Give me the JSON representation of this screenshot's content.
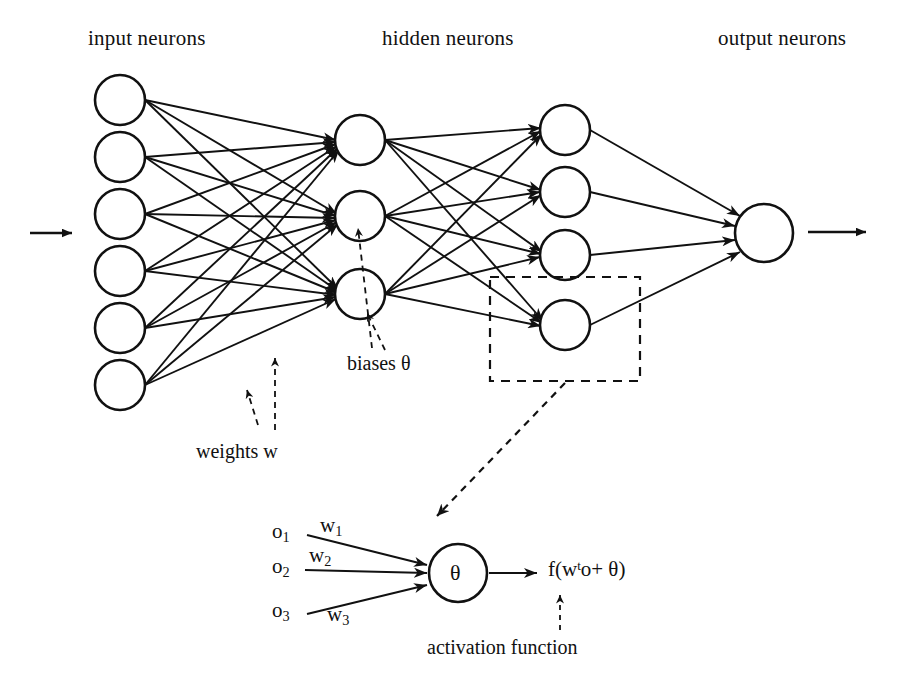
{
  "figure": {
    "background_color": "#ffffff",
    "stroke_color": "#111111"
  },
  "layer_labels": {
    "input": "input neurons",
    "hidden": "hidden neurons",
    "output": "output neurons"
  },
  "annotations": {
    "weights": "weights w",
    "biases": "biases  θ",
    "activation": "activation function"
  },
  "inset": {
    "input_1": "o",
    "input_1_sub": "1",
    "input_2": "o",
    "input_2_sub": "2",
    "input_3": "o",
    "input_3_sub": "3",
    "weight_1": "w",
    "weight_1_sub": "1",
    "weight_2": "w",
    "weight_2_sub": "2",
    "weight_3": "w",
    "weight_3_sub": "3",
    "neuron_symbol": "θ",
    "output_f": "f(w",
    "output_sup": "t",
    "output_rest": "o+ θ)"
  },
  "network": {
    "layers": [
      {
        "name": "input",
        "count": 6,
        "cx": 120,
        "r": 25,
        "ys": [
          100,
          157,
          214,
          271,
          328,
          385
        ]
      },
      {
        "name": "hidden1",
        "count": 3,
        "cx": 360,
        "r": 25,
        "ys": [
          140,
          216,
          294
        ]
      },
      {
        "name": "hidden2",
        "count": 4,
        "cx": 565,
        "r": 25,
        "ys": [
          130,
          192,
          255,
          325
        ]
      },
      {
        "name": "output",
        "count": 1,
        "cx": 764,
        "r": 29,
        "ys": [
          233
        ]
      }
    ],
    "entry_arrow": {
      "x1": 30,
      "y1": 233,
      "x2": 72,
      "y2": 233
    },
    "exit_arrow": {
      "x1": 808,
      "y1": 232,
      "x2": 866,
      "y2": 232
    },
    "detail_box": {
      "x": 490,
      "y": 277,
      "w": 150,
      "h": 104
    }
  }
}
